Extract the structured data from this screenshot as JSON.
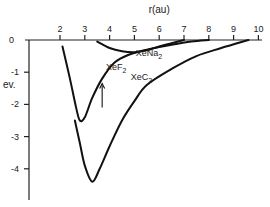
{
  "chart_data": {
    "type": "line",
    "title": "",
    "xlabel": "r(au)",
    "ylabel": "ev.",
    "xlim": [
      0.4,
      10
    ],
    "ylim": [
      -5,
      0
    ],
    "x_ticks": [
      2,
      3,
      4,
      5,
      6,
      7,
      8,
      9,
      10
    ],
    "x_tick_labels": [
      "2",
      "3",
      "4",
      "5",
      "6",
      "7",
      "8",
      "9",
      "10"
    ],
    "y_ticks": [
      0,
      -1,
      -2,
      -3,
      -4
    ],
    "y_tick_labels": [
      "0",
      "-1",
      "-2",
      "-3",
      "-4"
    ],
    "grid": false,
    "legend": "none",
    "series": [
      {
        "name": "XeF2",
        "label": "XeF2",
        "points": [
          [
            2.1,
            -0.2
          ],
          [
            2.4,
            -1.2
          ],
          [
            2.65,
            -2.1
          ],
          [
            2.8,
            -2.5
          ],
          [
            3.0,
            -2.4
          ],
          [
            3.3,
            -1.8
          ],
          [
            3.7,
            -1.2
          ],
          [
            4.2,
            -0.7
          ],
          [
            4.8,
            -0.45
          ],
          [
            5.5,
            -0.3
          ],
          [
            6.5,
            -0.15
          ],
          [
            7.3,
            -0.05
          ],
          [
            8.0,
            0
          ]
        ]
      },
      {
        "name": "XeNa2",
        "label": "XeNa2",
        "points": [
          [
            3.5,
            -0.05
          ],
          [
            4.0,
            -0.25
          ],
          [
            4.5,
            -0.35
          ],
          [
            5.0,
            -0.38
          ],
          [
            5.5,
            -0.32
          ],
          [
            6.0,
            -0.2
          ],
          [
            6.5,
            -0.1
          ],
          [
            7.0,
            0
          ]
        ]
      },
      {
        "name": "XeC2",
        "label": "XeC2",
        "points": [
          [
            2.6,
            -2.5
          ],
          [
            2.8,
            -3.2
          ],
          [
            3.0,
            -3.9
          ],
          [
            3.3,
            -4.4
          ],
          [
            3.6,
            -4.0
          ],
          [
            4.0,
            -3.3
          ],
          [
            4.5,
            -2.5
          ],
          [
            5.0,
            -1.9
          ],
          [
            5.5,
            -1.4
          ],
          [
            6.5,
            -0.9
          ],
          [
            7.5,
            -0.5
          ],
          [
            8.5,
            -0.25
          ],
          [
            9.6,
            0
          ]
        ]
      }
    ],
    "annotations": [
      {
        "type": "arrow",
        "series": "XeF2",
        "x": 3.7,
        "from_y": -2.1,
        "to_y": -1.35
      }
    ]
  }
}
